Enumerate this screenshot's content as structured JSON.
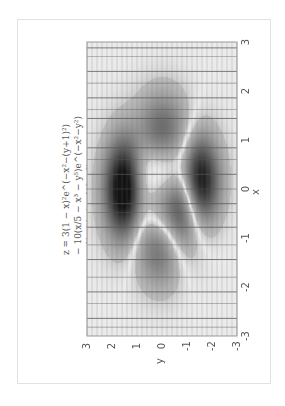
{
  "chart_data": {
    "type": "heatmap",
    "function": "peaks",
    "orientation": "rotated-90-clockwise",
    "title_lines": [
      "z = 3(1 − x)²e^(−x²−(y+1)²)",
      "− 10(x/5 − x³ − y⁵)e^(−x²−y²)",
      "− ⅓e^(−(x+1)²−y²)"
    ],
    "xlabel": "x",
    "ylabel": "y",
    "xlim": [
      -3,
      3
    ],
    "ylim": [
      -3,
      3
    ],
    "x_ticks": [
      "-3",
      "-2",
      "-1",
      "0",
      "1",
      "2",
      "3"
    ],
    "y_ticks": [
      "3",
      "2",
      "1",
      "0",
      "-1",
      "-2",
      "-3"
    ],
    "colormap": "gray",
    "grid": true,
    "legend": "none"
  },
  "colors": {
    "background": "#ffffff",
    "frame": "#e2e2e2",
    "text": "#555555",
    "grid_line": "#555555"
  }
}
